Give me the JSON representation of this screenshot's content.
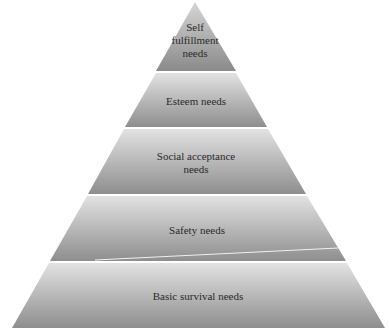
{
  "diagram": {
    "type": "pyramid",
    "tiers": [
      {
        "label_lines": [
          "Self",
          "fulfillment",
          "needs"
        ],
        "label": "Self fulfillment needs"
      },
      {
        "label_lines": [
          "Esteem needs"
        ],
        "label": "Esteem needs"
      },
      {
        "label_lines": [
          "Social acceptance",
          "needs"
        ],
        "label": "Social acceptance needs"
      },
      {
        "label_lines": [
          "Safety needs"
        ],
        "label": "Safety needs"
      },
      {
        "label_lines": [
          "Basic survival needs"
        ],
        "label": "Basic survival needs"
      }
    ],
    "colors": {
      "tier_top": "#dcdcdc",
      "tier_bottom": "#8c8c8c",
      "text": "#2a2a2a"
    }
  }
}
